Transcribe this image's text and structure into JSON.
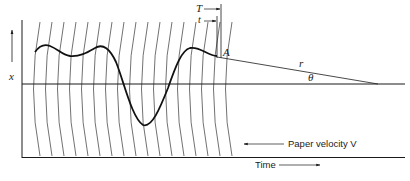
{
  "figure": {
    "type": "recording-pen-geometry",
    "labels": {
      "x_axis": "x",
      "T": "T",
      "t": "t",
      "A": "A",
      "r": "r",
      "theta": "θ",
      "paper_velocity": "Paper velocity V",
      "time": "Time"
    },
    "colors": {
      "ink": "#1a1a1a",
      "arc": "#333333",
      "background": "#ffffff"
    }
  }
}
